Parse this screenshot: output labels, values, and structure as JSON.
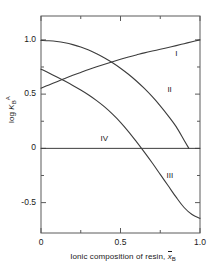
{
  "chart_data": {
    "type": "line",
    "title": "",
    "xlabel": "Ionic composition of resin, x̄B",
    "ylabel": "log K B A",
    "xlim": [
      0,
      1.0
    ],
    "ylim": [
      -0.78,
      1.22
    ],
    "grid": false,
    "legend": "inline-curve-labels",
    "xticks": [
      0,
      0.5,
      1.0
    ],
    "xtick_labels": [
      "0",
      "0.5",
      "1.0"
    ],
    "xminor_ticks": [
      0.25,
      0.75
    ],
    "yticks": [
      1.0,
      0.5,
      0,
      -0.5
    ],
    "ytick_labels": [
      "1.0",
      "0.5",
      "0",
      "-0.5"
    ],
    "yminor_ticks": [
      0.75,
      0.25,
      -0.25
    ],
    "series": [
      {
        "name": "I",
        "label": "I",
        "label_x": 0.87,
        "label_y": 0.86,
        "x": [
          0.0,
          0.05,
          0.1,
          0.15,
          0.2,
          0.25,
          0.3,
          0.35,
          0.4,
          0.45,
          0.5,
          0.55,
          0.6,
          0.65,
          0.7,
          0.75,
          0.8,
          0.85,
          0.9,
          0.95,
          1.0
        ],
        "y": [
          0.555,
          0.585,
          0.615,
          0.645,
          0.673,
          0.7,
          0.727,
          0.752,
          0.776,
          0.799,
          0.821,
          0.842,
          0.861,
          0.88,
          0.897,
          0.913,
          0.93,
          0.947,
          0.965,
          0.983,
          1.0
        ]
      },
      {
        "name": "II",
        "label": "II",
        "label_x": 0.82,
        "label_y": 0.525,
        "x": [
          0.0,
          0.05,
          0.1,
          0.15,
          0.2,
          0.25,
          0.3,
          0.35,
          0.4,
          0.45,
          0.5,
          0.55,
          0.6,
          0.65,
          0.7,
          0.75,
          0.8,
          0.85,
          0.9,
          0.93
        ],
        "y": [
          0.995,
          0.992,
          0.985,
          0.973,
          0.956,
          0.934,
          0.906,
          0.872,
          0.833,
          0.789,
          0.739,
          0.683,
          0.621,
          0.552,
          0.476,
          0.392,
          0.3,
          0.2,
          0.075,
          0.0
        ]
      },
      {
        "name": "III",
        "label": "III",
        "label_x": 0.815,
        "label_y": -0.265,
        "x": [
          0.0,
          0.05,
          0.1,
          0.15,
          0.2,
          0.25,
          0.3,
          0.35,
          0.4,
          0.45,
          0.5,
          0.55,
          0.6,
          0.65,
          0.7,
          0.75,
          0.8,
          0.85,
          0.9,
          0.95,
          1.0
        ],
        "y": [
          0.73,
          0.695,
          0.658,
          0.62,
          0.58,
          0.538,
          0.492,
          0.44,
          0.382,
          0.315,
          0.24,
          0.155,
          0.062,
          -0.035,
          -0.135,
          -0.24,
          -0.345,
          -0.45,
          -0.545,
          -0.61,
          -0.645
        ]
      },
      {
        "name": "IV",
        "label": "IV",
        "label_x": 0.4,
        "label_y": 0.075,
        "x": [
          0.0,
          1.0
        ],
        "y": [
          0.0,
          0.0
        ]
      }
    ]
  }
}
